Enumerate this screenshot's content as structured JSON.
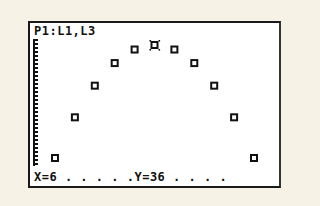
{
  "screen": {
    "plot_label": "P1:L1,L3",
    "status_x": "X=6",
    "status_dots_1": " . . . . ",
    "status_y": ".Y=36",
    "status_dots_2": " . . . ."
  },
  "chart_data": {
    "type": "scatter",
    "title": "P1:L1,L3",
    "xlabel": "L1",
    "ylabel": "L3",
    "x": [
      1,
      2,
      3,
      4,
      5,
      6,
      7,
      8,
      9,
      10,
      11
    ],
    "y": [
      11,
      20,
      27,
      32,
      35,
      36,
      35,
      32,
      27,
      20,
      11
    ],
    "marker": "square",
    "trace_cursor": {
      "x": 6,
      "y": 36
    },
    "grid": false
  },
  "colors": {
    "background": "#f6f3e6",
    "screen": "#ffffff",
    "ink": "#111111"
  }
}
